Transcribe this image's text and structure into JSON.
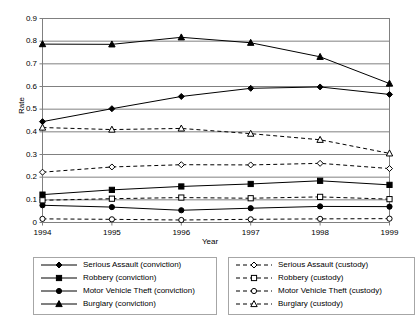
{
  "axes": {
    "ylabel": "Rate",
    "xlabel": "Year",
    "yticks": [
      "0.9",
      "0.8",
      "0.7",
      "0.6",
      "0.5",
      "0.4",
      "0.3",
      "0.2",
      "0.1",
      "0"
    ],
    "xticks": [
      "1994",
      "1995",
      "1996",
      "1997",
      "1998",
      "1999"
    ]
  },
  "legend": {
    "left": [
      {
        "label": "Serious Assault (conviction)",
        "marker": "diamond-filled-marker",
        "line": "solid"
      },
      {
        "label": "Robbery (conviction)",
        "marker": "square-filled-marker",
        "line": "solid"
      },
      {
        "label": "Motor Vehicle Theft (conviction)",
        "marker": "circle-filled-marker",
        "line": "solid"
      },
      {
        "label": "Burglary (conviction)",
        "marker": "triangle-filled-marker",
        "line": "solid"
      }
    ],
    "right": [
      {
        "label": "Serious Assault (custody)",
        "marker": "diamond-open-marker",
        "line": "dashed"
      },
      {
        "label": "Robbery (custody)",
        "marker": "square-open-marker",
        "line": "dashed"
      },
      {
        "label": "Motor Vehicle Theft  (custody)",
        "marker": "circle-open-marker",
        "line": "dashed"
      },
      {
        "label": "Burglary (custody)",
        "marker": "triangle-open-marker",
        "line": "dashed"
      }
    ]
  },
  "chart_data": {
    "type": "line",
    "title": "",
    "xlabel": "Year",
    "ylabel": "Rate",
    "x": [
      1994,
      1995,
      1996,
      1997,
      1998,
      1999
    ],
    "categories": [
      "1994",
      "1995",
      "1996",
      "1997",
      "1998",
      "1999"
    ],
    "ylim": [
      0,
      0.9
    ],
    "ytick_step": 0.1,
    "grid": "horizontal",
    "legend_position": "bottom",
    "series": [
      {
        "name": "Serious Assault (conviction)",
        "marker": "diamond-filled-marker",
        "line": "solid",
        "color": "#000000",
        "values": [
          0.445,
          0.502,
          0.556,
          0.592,
          0.598,
          0.565
        ]
      },
      {
        "name": "Robbery (conviction)",
        "marker": "square-filled-marker",
        "line": "solid",
        "color": "#000000",
        "values": [
          0.123,
          0.144,
          0.159,
          0.17,
          0.184,
          0.166
        ]
      },
      {
        "name": "Motor Vehicle Theft (conviction)",
        "marker": "circle-filled-marker",
        "line": "solid",
        "color": "#000000",
        "values": [
          0.076,
          0.068,
          0.054,
          0.063,
          0.071,
          0.07
        ]
      },
      {
        "name": "Burglary (conviction)",
        "marker": "triangle-filled-marker",
        "line": "solid",
        "color": "#000000",
        "values": [
          0.787,
          0.786,
          0.817,
          0.793,
          0.731,
          0.613
        ]
      },
      {
        "name": "Serious Assault (custody)",
        "marker": "diamond-open-marker",
        "line": "dashed",
        "color": "#000000",
        "values": [
          0.222,
          0.245,
          0.255,
          0.254,
          0.261,
          0.238
        ]
      },
      {
        "name": "Robbery (custody)",
        "marker": "square-open-marker",
        "line": "dashed",
        "color": "#000000",
        "values": [
          0.098,
          0.105,
          0.11,
          0.107,
          0.113,
          0.103
        ]
      },
      {
        "name": "Motor Vehicle Theft  (custody)",
        "marker": "circle-open-marker",
        "line": "dashed",
        "color": "#000000",
        "values": [
          0.016,
          0.014,
          0.011,
          0.014,
          0.016,
          0.017
        ]
      },
      {
        "name": "Burglary (custody)",
        "marker": "triangle-open-marker",
        "line": "dashed",
        "color": "#000000",
        "values": [
          0.419,
          0.41,
          0.415,
          0.392,
          0.365,
          0.305
        ]
      }
    ]
  }
}
